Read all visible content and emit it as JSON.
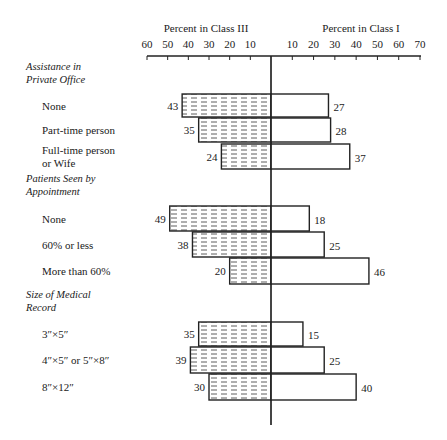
{
  "chart_data": {
    "type": "bar",
    "orientation": "horizontal-diverging",
    "left_axis_title": "Percent in Class III",
    "right_axis_title": "Percent in Class I",
    "left_ticks": [
      60,
      50,
      40,
      30,
      20,
      10
    ],
    "right_ticks": [
      10,
      20,
      30,
      40,
      50,
      60,
      70
    ],
    "left_range": [
      0,
      60
    ],
    "right_range": [
      0,
      70
    ],
    "series": [
      {
        "name": "Class III",
        "side": "left",
        "fill": "hatched-dashes"
      },
      {
        "name": "Class I",
        "side": "right",
        "fill": "white"
      }
    ],
    "groups": [
      {
        "title_lines": [
          "Assistance in",
          "Private Office"
        ],
        "items": [
          {
            "label_lines": [
              "None"
            ],
            "class_iii": 43,
            "class_i": 27
          },
          {
            "label_lines": [
              "Part-time person"
            ],
            "class_iii": 35,
            "class_i": 28
          },
          {
            "label_lines": [
              "Full-time person",
              "or Wife"
            ],
            "class_iii": 24,
            "class_i": 37
          }
        ]
      },
      {
        "title_lines": [
          "Patients Seen by",
          "Appointment"
        ],
        "items": [
          {
            "label_lines": [
              "None"
            ],
            "class_iii": 49,
            "class_i": 18
          },
          {
            "label_lines": [
              "60% or less"
            ],
            "class_iii": 38,
            "class_i": 25
          },
          {
            "label_lines": [
              "More than 60%"
            ],
            "class_iii": 20,
            "class_i": 46
          }
        ]
      },
      {
        "title_lines": [
          "Size of Medical",
          "Record"
        ],
        "items": [
          {
            "label_lines": [
              "3″×5″"
            ],
            "class_iii": 35,
            "class_i": 15
          },
          {
            "label_lines": [
              "4″×5″ or 5″×8″"
            ],
            "class_iii": 39,
            "class_i": 25
          },
          {
            "label_lines": [
              "8″×12″"
            ],
            "class_iii": 30,
            "class_i": 40
          }
        ]
      }
    ],
    "grid": false,
    "legend": "none"
  }
}
